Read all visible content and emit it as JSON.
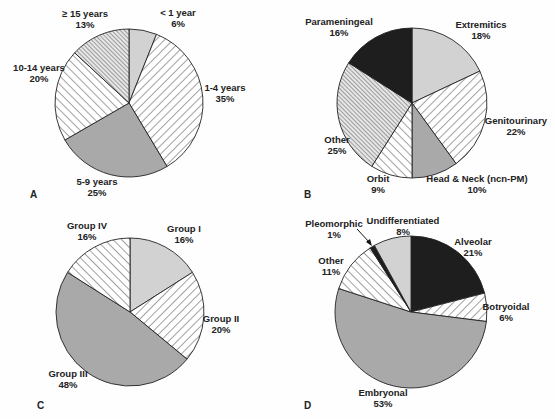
{
  "chart_data": [
    {
      "panel": "A",
      "type": "pie",
      "title": "",
      "center": [
        129,
        103
      ],
      "radius": 74,
      "slices": [
        {
          "label": "< 1 year",
          "pct_label": "6%",
          "value": 6,
          "fill": "gray-light",
          "lx": 178,
          "ly": 16
        },
        {
          "label": "1-4 years",
          "pct_label": "35%",
          "value": 35,
          "fill": "hatch-wide",
          "lx": 225,
          "ly": 91
        },
        {
          "label": "5-9 years",
          "pct_label": "25%",
          "value": 25,
          "fill": "gray-mid",
          "lx": 97,
          "ly": 185
        },
        {
          "label": "10-14 years",
          "pct_label": "20%",
          "value": 20,
          "fill": "hatch-back",
          "lx": 39,
          "ly": 71
        },
        {
          "label": "≥ 15 years",
          "pct_label": "13%",
          "value": 13,
          "fill": "hatch-dense",
          "lx": 85,
          "ly": 17
        }
      ]
    },
    {
      "panel": "B",
      "type": "pie",
      "title": "",
      "center": [
        412,
        103
      ],
      "radius": 75,
      "slices": [
        {
          "label": "Extremitics",
          "pct_label": "18%",
          "value": 18,
          "fill": "gray-light",
          "lx": 481,
          "ly": 28
        },
        {
          "label": "Genitourinary",
          "pct_label": "22%",
          "value": 22,
          "fill": "hatch-wide",
          "lx": 516,
          "ly": 124
        },
        {
          "label": "Head & Neck (ncn-PM)",
          "pct_label": "10%",
          "value": 10,
          "fill": "gray-mid",
          "lx": 477,
          "ly": 182
        },
        {
          "label": "Orbit",
          "pct_label": "9%",
          "value": 9,
          "fill": "hatch-back",
          "lx": 378,
          "ly": 182
        },
        {
          "label": "Other",
          "pct_label": "25%",
          "value": 25,
          "fill": "hatch-dense",
          "lx": 337,
          "ly": 143
        },
        {
          "label": "Parameningeal",
          "pct_label": "16%",
          "value": 16,
          "fill": "black",
          "lx": 339,
          "ly": 25
        }
      ]
    },
    {
      "panel": "C",
      "type": "pie",
      "title": "",
      "center": [
        130,
        312
      ],
      "radius": 74,
      "slices": [
        {
          "label": "Group I",
          "pct_label": "16%",
          "value": 16,
          "fill": "gray-light",
          "lx": 184,
          "ly": 232
        },
        {
          "label": "Group II",
          "pct_label": "20%",
          "value": 20,
          "fill": "hatch-wide",
          "lx": 221,
          "ly": 322
        },
        {
          "label": "Group III",
          "pct_label": "48%",
          "value": 48,
          "fill": "gray-mid",
          "lx": 68,
          "ly": 377
        },
        {
          "label": "Group IV",
          "pct_label": "16%",
          "value": 16,
          "fill": "hatch-back",
          "lx": 87,
          "ly": 229
        }
      ]
    },
    {
      "panel": "D",
      "type": "pie",
      "title": "",
      "center": [
        411,
        312
      ],
      "radius": 76,
      "slices": [
        {
          "label": "Alveolar",
          "pct_label": "21%",
          "value": 21,
          "fill": "black",
          "lx": 473,
          "ly": 245
        },
        {
          "label": "Botryoidal",
          "pct_label": "6%",
          "value": 6,
          "fill": "hatch-wide",
          "lx": 506,
          "ly": 310
        },
        {
          "label": "Embryonal",
          "pct_label": "53%",
          "value": 53,
          "fill": "gray-mid",
          "lx": 383,
          "ly": 396
        },
        {
          "label": "Other",
          "pct_label": "11%",
          "value": 11,
          "fill": "hatch-back",
          "lx": 331,
          "ly": 264
        },
        {
          "label": "Pleomorphic",
          "pct_label": "1%",
          "value": 1,
          "fill": "black",
          "lx": 334,
          "ly": 227
        },
        {
          "label": "Undifferentiated",
          "pct_label": "8%",
          "value": 8,
          "fill": "gray-light",
          "lx": 403,
          "ly": 224
        }
      ]
    }
  ],
  "panels": {
    "A": {
      "letter": "A",
      "x": 30,
      "y": 198
    },
    "B": {
      "letter": "B",
      "x": 304,
      "y": 198
    },
    "C": {
      "letter": "C",
      "x": 37,
      "y": 409
    },
    "D": {
      "letter": "D",
      "x": 304,
      "y": 409
    }
  },
  "colors": {
    "gray-light": "#d2d2d2",
    "gray-mid": "#a9a9a9",
    "black": "#1e1e1e",
    "outline": "#222222",
    "background": "#fefefe"
  }
}
